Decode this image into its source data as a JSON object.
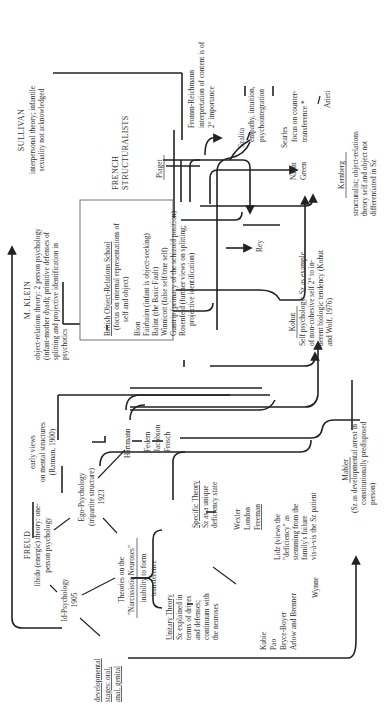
{
  "diagram": {
    "orientation": "rotated 90 degrees counter-clockwise",
    "freud": {
      "title": "FREUD",
      "lines": [
        "libido (energic) theory: one-",
        "person psychology"
      ]
    },
    "id_psychology": {
      "lines": [
        "Id-Psychology",
        "1905"
      ]
    },
    "ego_psychology": {
      "lines": [
        "Ego-Psychology",
        "(tripartite structure)",
        "1923"
      ]
    },
    "developmental": {
      "lines": [
        "developmental",
        "stages: oral,",
        "anal, genital"
      ]
    },
    "narcissistic": {
      "lines": [
        "Theories on the",
        "\"Narcissistic Neuroses\""
      ],
      "sub": [
        "inability to form",
        "transference"
      ]
    },
    "unitary": {
      "title": "Unitary Theory",
      "lines": [
        "Sz explained in",
        "terms of drives",
        "and defenses;",
        "continuum with",
        "the neuroses"
      ],
      "names": [
        "Kubie",
        "Pao",
        "Bryce-Boyer",
        "Arlow and Brenner"
      ]
    },
    "specific": {
      "title": "Specific Theory",
      "lines": [
        "Sz as a unique",
        "deficiency state"
      ],
      "names": [
        "Wexler",
        "London",
        "Freeman"
      ]
    },
    "lidz": {
      "lines": [
        "Lidz (views the",
        "\"deficiency\" as",
        "stemming from the",
        "family's failure",
        "vis-à-vis the Sz patient"
      ]
    },
    "wynne": {
      "label": "Wynne"
    },
    "early_views": {
      "lines": [
        "early views",
        "on mental structures",
        "(Ratman, 1900)"
      ]
    },
    "hartmann": {
      "label": "Hartmann",
      "names": [
        "Federn",
        "Jacobson",
        "Frosch"
      ]
    },
    "mahler": {
      "title": "Mahler",
      "lines": [
        "(Sz as developmental arrest in",
        "constitutionally predisposed",
        "person)"
      ]
    },
    "klein": {
      "title": "M. KLEIN",
      "lines": [
        "object-relations theory: 2 person psychology",
        "(infant-mother dyad); primitive defenses of",
        "splitting and projective identification in",
        "psychotics"
      ]
    },
    "british_school": {
      "title": "British Object-Relations School",
      "focus": [
        "(focus on internal representations of",
        "self and object)"
      ],
      "names": [
        "Bion",
        "Fairbairn (infant is object-seeking)",
        "Balint (the Basic Fault)",
        "Winnicott (false self/true self)",
        "Guntrip (primacy of the schizoid position)",
        "Rosenfeld (further views on splitting;",
        "projective identification)"
      ]
    },
    "rey": {
      "label": "Rey"
    },
    "kohut": {
      "title": "Kohut",
      "lines": [
        "Self psychology: Sz as example",
        "of non-cohesive self 2° to in-",
        "herent biologic tendency (Kohut",
        "and Wolf, 1976)"
      ]
    },
    "french": {
      "lines": [
        "FRENCH",
        "STRUCTURALISTS"
      ],
      "piaget": "Piaget",
      "names": [
        "Nacht",
        "Green"
      ]
    },
    "sullivan": {
      "title": "SULLIVAN",
      "lines": [
        "interpersonal theory; infantile",
        "sexuality not acknowledged"
      ]
    },
    "fromm": {
      "lines": [
        "Fromm-Reichmann",
        "interpretation of content is of",
        "2° importance"
      ]
    },
    "szalita": {
      "lines": [
        "Szalita",
        "empathy, intuition,",
        "psychointegration"
      ]
    },
    "searles": {
      "lines": [
        "Searles",
        "focus on counter-",
        "transference *"
      ]
    },
    "arieti": {
      "label": "Arieti"
    },
    "kernberg": {
      "title": "Kernberg",
      "lines": [
        "structuralist; object-relations",
        "theory self and object not",
        "differentiated in Sz"
      ]
    }
  }
}
